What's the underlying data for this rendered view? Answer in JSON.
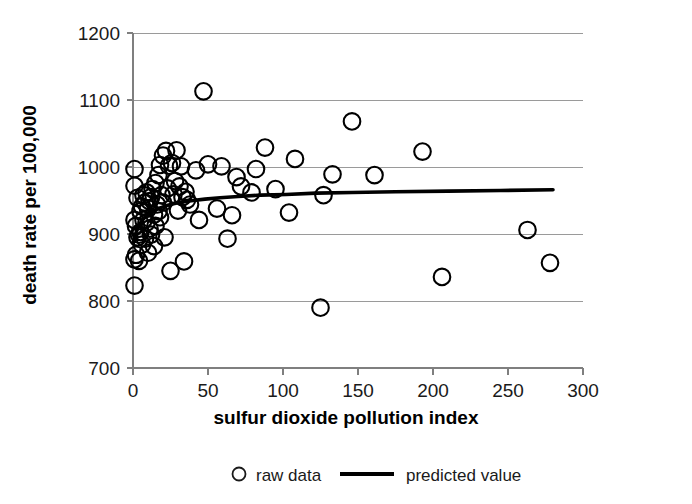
{
  "chart_data": {
    "type": "scatter",
    "title": "",
    "xlabel": "sulfur dioxide pollution index",
    "ylabel": "death rate per 100,000",
    "xlim": [
      0,
      300
    ],
    "ylim": [
      700,
      1200
    ],
    "xticks": [
      0,
      50,
      100,
      150,
      200,
      250,
      300
    ],
    "yticks": [
      700,
      800,
      900,
      1000,
      1100,
      1200
    ],
    "grid": "horizontal",
    "legend_position": "bottom",
    "series": [
      {
        "name": "raw data",
        "marker": "open-circle",
        "color": "#000000",
        "points": [
          [
            1,
            921
          ],
          [
            1,
            997
          ],
          [
            1,
            972
          ],
          [
            1,
            862
          ],
          [
            1,
            823
          ],
          [
            2,
            912
          ],
          [
            2,
            869
          ],
          [
            3,
            954
          ],
          [
            3,
            895
          ],
          [
            4,
            899
          ],
          [
            4,
            860
          ],
          [
            5,
            934
          ],
          [
            5,
            903
          ],
          [
            6,
            941
          ],
          [
            6,
            884
          ],
          [
            7,
            958
          ],
          [
            7,
            921
          ],
          [
            8,
            947
          ],
          [
            8,
            893
          ],
          [
            9,
            962
          ],
          [
            9,
            917
          ],
          [
            10,
            938
          ],
          [
            10,
            872
          ],
          [
            11,
            949
          ],
          [
            11,
            908
          ],
          [
            12,
            955
          ],
          [
            12,
            899
          ],
          [
            13,
            967
          ],
          [
            14,
            929
          ],
          [
            14,
            882
          ],
          [
            15,
            976
          ],
          [
            15,
            912
          ],
          [
            16,
            944
          ],
          [
            17,
            988
          ],
          [
            17,
            934
          ],
          [
            18,
            1003
          ],
          [
            18,
            925
          ],
          [
            19,
            958
          ],
          [
            20,
            1017
          ],
          [
            20,
            947
          ],
          [
            21,
            895
          ],
          [
            22,
            1024
          ],
          [
            23,
            968
          ],
          [
            24,
            1002
          ],
          [
            25,
            845
          ],
          [
            26,
            1006
          ],
          [
            27,
            959
          ],
          [
            28,
            979
          ],
          [
            29,
            1025
          ],
          [
            30,
            935
          ],
          [
            31,
            971
          ],
          [
            32,
            1001
          ],
          [
            33,
            955
          ],
          [
            34,
            859
          ],
          [
            35,
            963
          ],
          [
            36,
            951
          ],
          [
            38,
            944
          ],
          [
            42,
            995
          ],
          [
            44,
            921
          ],
          [
            47,
            1113
          ],
          [
            50,
            1004
          ],
          [
            56,
            938
          ],
          [
            59,
            1001
          ],
          [
            63,
            893
          ],
          [
            66,
            928
          ],
          [
            69,
            985
          ],
          [
            72,
            971
          ],
          [
            79,
            962
          ],
          [
            82,
            997
          ],
          [
            88,
            1029
          ],
          [
            95,
            967
          ],
          [
            104,
            932
          ],
          [
            108,
            1012
          ],
          [
            125,
            790
          ],
          [
            127,
            958
          ],
          [
            133,
            989
          ],
          [
            146,
            1068
          ],
          [
            161,
            988
          ],
          [
            193,
            1023
          ],
          [
            206,
            836
          ],
          [
            263,
            906
          ],
          [
            278,
            857
          ]
        ]
      },
      {
        "name": "predicted value",
        "type": "line",
        "color": "#000000",
        "points": [
          [
            0,
            886
          ],
          [
            2,
            902
          ],
          [
            4,
            913
          ],
          [
            6,
            920
          ],
          [
            8,
            925
          ],
          [
            11,
            931
          ],
          [
            14,
            935
          ],
          [
            18,
            939
          ],
          [
            22,
            942
          ],
          [
            27,
            945
          ],
          [
            33,
            948
          ],
          [
            40,
            950
          ],
          [
            48,
            952
          ],
          [
            58,
            954
          ],
          [
            70,
            956
          ],
          [
            85,
            958
          ],
          [
            102,
            959
          ],
          [
            122,
            961
          ],
          [
            146,
            962
          ],
          [
            175,
            963
          ],
          [
            210,
            964
          ],
          [
            245,
            965
          ],
          [
            280,
            966
          ]
        ]
      }
    ]
  },
  "legend": {
    "entries": [
      {
        "label": "raw data",
        "marker": "open-circle"
      },
      {
        "label": "predicted value",
        "marker": "line"
      }
    ]
  }
}
